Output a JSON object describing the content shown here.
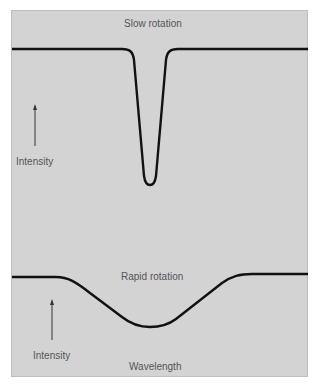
{
  "figure": {
    "panels": [
      {
        "title": "Slow rotation",
        "ylabel": "Intensity",
        "description": "Narrow, deep absorption line"
      },
      {
        "title": "Rapid rotation",
        "ylabel": "Intensity",
        "xlabel": "Wavelength",
        "description": "Broad, shallow absorption line"
      }
    ]
  },
  "colors": {
    "background": "#d3d3d3",
    "curve": "#111111",
    "text": "#555555"
  }
}
